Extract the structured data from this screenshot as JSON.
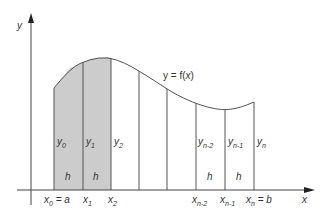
{
  "diagram": {
    "colors": {
      "axis": "#444444",
      "curve": "#555555",
      "shade": "#cccccc",
      "strip_line": "#555555",
      "text": "#333333"
    },
    "axes": {
      "x_label": "x",
      "y_label": "y"
    },
    "curve_label": {
      "prefix": "y = f(",
      "var": "x",
      "suffix": ")"
    },
    "ordinates": [
      {
        "base": "y",
        "sub": "0"
      },
      {
        "base": "y",
        "sub": "1"
      },
      {
        "base": "y",
        "sub": "2"
      },
      {
        "base": "y",
        "sub": "n-2"
      },
      {
        "base": "y",
        "sub": "n-1"
      },
      {
        "base": "y",
        "sub": "n"
      }
    ],
    "abscissae": [
      {
        "base": "x",
        "sub": "0",
        "suffix": " = a"
      },
      {
        "base": "x",
        "sub": "1",
        "suffix": ""
      },
      {
        "base": "x",
        "sub": "2",
        "suffix": ""
      },
      {
        "base": "x",
        "sub": "n-2",
        "suffix": ""
      },
      {
        "base": "x",
        "sub": "n-1",
        "suffix": ""
      },
      {
        "base": "x",
        "sub": "n",
        "suffix": " = b"
      }
    ],
    "strip_width_label": "h",
    "shaded_strips": 2,
    "total_strip_lines": 8
  }
}
